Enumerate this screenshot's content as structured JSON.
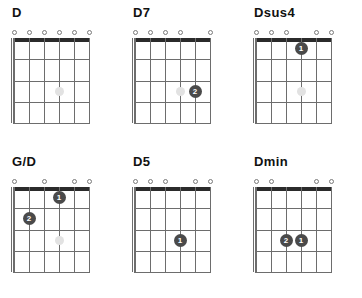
{
  "chart_data": {
    "type": "table",
    "layout": {
      "rows": 2,
      "columns": 3,
      "strings": 6,
      "frets": 4
    },
    "marker_colors": {
      "finger": "#4a4a4a",
      "nut": "#2b2b2b",
      "grid": "#6d6d6d",
      "ghost": "#e2e2e2",
      "title": "#111111"
    },
    "chords": [
      {
        "name": "D",
        "open_strings": [
          1,
          2,
          3,
          4,
          5,
          6
        ],
        "muted_strings": [],
        "fingers": [],
        "ghost_dots": [
          {
            "string": 4,
            "fret": 3
          }
        ]
      },
      {
        "name": "D7",
        "open_strings": [
          1,
          2,
          3,
          4,
          6
        ],
        "muted_strings": [],
        "fingers": [
          {
            "string": 5,
            "fret": 3,
            "label": "2"
          }
        ],
        "ghost_dots": [
          {
            "string": 4,
            "fret": 3
          }
        ]
      },
      {
        "name": "Dsus4",
        "open_strings": [
          1,
          2,
          3,
          5,
          6
        ],
        "muted_strings": [],
        "fingers": [
          {
            "string": 4,
            "fret": 1,
            "label": "1"
          }
        ],
        "ghost_dots": [
          {
            "string": 4,
            "fret": 3
          }
        ]
      },
      {
        "name": "G/D",
        "open_strings": [
          1,
          3,
          5,
          6
        ],
        "muted_strings": [],
        "fingers": [
          {
            "string": 4,
            "fret": 1,
            "label": "1"
          },
          {
            "string": 2,
            "fret": 2,
            "label": "2"
          }
        ],
        "ghost_dots": [
          {
            "string": 4,
            "fret": 3
          }
        ]
      },
      {
        "name": "D5",
        "open_strings": [
          1,
          2,
          3,
          5,
          6
        ],
        "muted_strings": [],
        "fingers": [
          {
            "string": 4,
            "fret": 3,
            "label": "1"
          }
        ],
        "ghost_dots": []
      },
      {
        "name": "Dmin",
        "open_strings": [
          1,
          2,
          5,
          6
        ],
        "muted_strings": [],
        "fingers": [
          {
            "string": 4,
            "fret": 3,
            "label": "1"
          },
          {
            "string": 3,
            "fret": 3,
            "label": "2"
          }
        ],
        "ghost_dots": []
      }
    ]
  }
}
